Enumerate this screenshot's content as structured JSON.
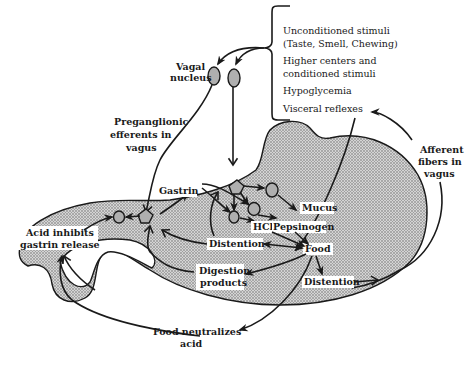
{
  "diagram": {
    "colors": {
      "stroke": "#1a1a1a",
      "stomach_fill": "#b8b8b8",
      "background": "#ffffff"
    },
    "stimuli_box": {
      "items": [
        {
          "line1": "Unconditioned stimuli",
          "line2": "(Taste, Smell, Chewing)"
        },
        {
          "line1": "Higher centers and",
          "line2": "conditioned stimuli"
        },
        {
          "line1": "Hypoglycemia",
          "line2": ""
        },
        {
          "line1": "Visceral reflexes",
          "line2": ""
        }
      ]
    },
    "labels": {
      "vagal_nucleus_1": "Vagal",
      "vagal_nucleus_2": "nucleus",
      "preganglionic_1": "Preganglionic",
      "preganglionic_2": "efferents in",
      "preganglionic_3": "vagus",
      "afferent_1": "Afferent",
      "afferent_2": "fibers in",
      "afferent_3": "vagus",
      "gastrin": "Gastrin",
      "mucus": "Mucus",
      "hcl": "HCl",
      "pepsinogen": "Pepsinogen",
      "distention_upper": "Distention",
      "food": "Food",
      "acid_inhibits_1": "Acid inhibits",
      "acid_inhibits_2": "gastrin release",
      "digestion_1": "Digestion",
      "digestion_2": "products",
      "distention_lower": "Distention",
      "food_neutralizes_1": "Food neutralizes",
      "food_neutralizes_2": "acid"
    },
    "icons": {
      "neuron_cell": "stippled-oval",
      "ganglion": "star-node",
      "arrow": "arrowhead"
    }
  }
}
